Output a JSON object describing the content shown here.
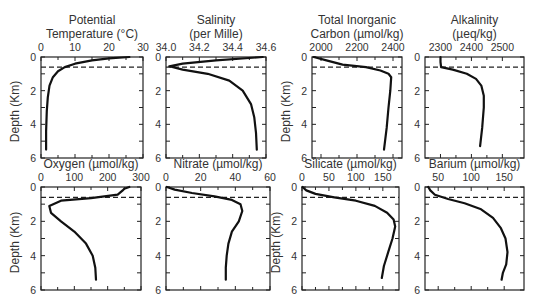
{
  "chart_data": [
    {
      "type": "line",
      "title": "Potential Temperature (°C)",
      "title_lines": [
        "Potential",
        "Temperature (°C)"
      ],
      "xlabel": "Potential Temperature (°C)",
      "ylabel": "Depth (Km)",
      "xlim": [
        0,
        30
      ],
      "xticks": [
        0,
        10,
        20,
        30
      ],
      "ylim": [
        6,
        0
      ],
      "yticks": [
        0,
        2,
        4,
        6
      ],
      "mixed_layer_depth": 0.6,
      "series": [
        {
          "name": "Potential Temperature",
          "x": [
            26,
            20,
            15,
            10,
            7,
            5,
            3.5,
            2.5,
            2,
            1.7,
            1.5,
            1.5
          ],
          "y": [
            0,
            0.08,
            0.2,
            0.4,
            0.6,
            0.85,
            1.2,
            1.7,
            2.4,
            3.2,
            4.4,
            5.5
          ]
        }
      ]
    },
    {
      "type": "line",
      "title": "Salinity (per Mille)",
      "title_lines": [
        "Salinity",
        "(per Mille)"
      ],
      "xlabel": "Salinity (per Mille)",
      "ylabel": "",
      "xlim": [
        34.0,
        34.6
      ],
      "xticks": [
        34.0,
        34.2,
        34.4,
        34.6
      ],
      "ylim": [
        6,
        0
      ],
      "yticks": [
        0,
        2,
        4,
        6
      ],
      "mixed_layer_depth": 0.6,
      "series": [
        {
          "name": "Salinity",
          "x": [
            34.58,
            34.3,
            34.1,
            34.02,
            34.1,
            34.25,
            34.38,
            34.46,
            34.51,
            34.53,
            34.54,
            34.545
          ],
          "y": [
            0,
            0.2,
            0.4,
            0.55,
            0.75,
            1.0,
            1.4,
            2.0,
            2.8,
            3.6,
            4.5,
            5.5
          ]
        }
      ]
    },
    {
      "type": "line",
      "title": "Total Inorganic Carbon (µmol/kg)",
      "title_lines": [
        "Total Inorganic",
        "Carbon (µmol/kg)"
      ],
      "xlabel": "Total Inorganic Carbon (µmol/kg)",
      "ylabel": "Depth (Km)",
      "xlim": [
        1950,
        2450
      ],
      "xticks": [
        2000,
        2200,
        2400
      ],
      "ylim": [
        6,
        0
      ],
      "yticks": [
        0,
        2,
        4,
        6
      ],
      "mixed_layer_depth": 0.6,
      "series": [
        {
          "name": "Total Inorganic Carbon",
          "x": [
            1960,
            2030,
            2120,
            2250,
            2330,
            2375,
            2390,
            2385,
            2375,
            2365,
            2350
          ],
          "y": [
            0,
            0.2,
            0.45,
            0.6,
            0.8,
            1.0,
            1.2,
            2.0,
            3.0,
            4.2,
            5.5
          ]
        }
      ]
    },
    {
      "type": "line",
      "title": "Alkalinity (µeq/kg)",
      "title_lines": [
        "Alkalinity",
        "(µeq/kg)"
      ],
      "xlabel": "Alkalinity (µeq/kg)",
      "ylabel": "",
      "xlim": [
        2250,
        2570
      ],
      "xticks": [
        2300,
        2400,
        2500
      ],
      "ylim": [
        6,
        0
      ],
      "yticks": [
        0,
        2,
        4,
        6
      ],
      "mixed_layer_depth": 0.6,
      "series": [
        {
          "name": "Alkalinity",
          "x": [
            2300,
            2300,
            2302,
            2340,
            2385,
            2415,
            2432,
            2440,
            2440,
            2435,
            2428
          ],
          "y": [
            0,
            0.3,
            0.6,
            0.75,
            1.0,
            1.3,
            1.7,
            2.3,
            3.0,
            4.2,
            5.3
          ]
        }
      ]
    },
    {
      "type": "line",
      "title": "Oxygen (µmol/kg)",
      "title_lines": [
        "Oxygen (µmol/kg)"
      ],
      "xlabel": "Oxygen (µmol/kg)",
      "ylabel": "Depth (Km)",
      "xlim": [
        0,
        300
      ],
      "xticks": [
        0,
        100,
        200,
        300
      ],
      "ylim": [
        6,
        0
      ],
      "yticks": [
        0,
        2,
        4,
        6
      ],
      "mixed_layer_depth": 0.6,
      "series": [
        {
          "name": "Oxygen",
          "x": [
            265,
            250,
            245,
            230,
            150,
            60,
            25,
            30,
            60,
            100,
            135,
            155,
            163,
            165
          ],
          "y": [
            0,
            0.1,
            0.2,
            0.45,
            0.65,
            0.8,
            1.1,
            1.5,
            2.0,
            2.6,
            3.3,
            4.0,
            4.7,
            5.4
          ]
        }
      ]
    },
    {
      "type": "line",
      "title": "Nitrate (µmol/kg)",
      "title_lines": [
        "Nitrate (µmol/kg)"
      ],
      "xlabel": "Nitrate (µmol/kg)",
      "ylabel": "",
      "xlim": [
        0,
        60
      ],
      "xticks": [
        0,
        20,
        40,
        60
      ],
      "ylim": [
        6,
        0
      ],
      "yticks": [
        0,
        2,
        4,
        6
      ],
      "mixed_layer_depth": 0.6,
      "series": [
        {
          "name": "Nitrate",
          "x": [
            0.5,
            5,
            15,
            28,
            38,
            43,
            44,
            42,
            38,
            36,
            35,
            34.5,
            34.5
          ],
          "y": [
            0,
            0.15,
            0.35,
            0.55,
            0.75,
            1.0,
            1.4,
            2.0,
            2.6,
            3.3,
            4.0,
            4.7,
            5.4
          ]
        }
      ]
    },
    {
      "type": "line",
      "title": "Silicate (µmol/kg)",
      "title_lines": [
        "Silicate (µmol/kg)"
      ],
      "xlabel": "Silicate (µmol/kg)",
      "ylabel": "Depth (Km)",
      "xlim": [
        0,
        180
      ],
      "xticks": [
        0,
        50,
        100,
        150
      ],
      "ylim": [
        6,
        0
      ],
      "yticks": [
        0,
        2,
        4,
        6
      ],
      "mixed_layer_depth": 0.6,
      "series": [
        {
          "name": "Silicate",
          "x": [
            1,
            8,
            25,
            60,
            100,
            135,
            158,
            170,
            173,
            168,
            160,
            152,
            148
          ],
          "y": [
            0,
            0.2,
            0.4,
            0.6,
            0.8,
            1.1,
            1.5,
            1.9,
            2.3,
            3.0,
            3.8,
            4.6,
            5.3
          ]
        }
      ]
    },
    {
      "type": "line",
      "title": "Barium (µmol/kg)",
      "title_lines": [
        "Barium (µmol/kg)"
      ],
      "xlabel": "Barium (µmol/kg)",
      "ylabel": "",
      "xlim": [
        30,
        180
      ],
      "xticks": [
        50,
        100,
        150
      ],
      "ylim": [
        6,
        0
      ],
      "yticks": [
        0,
        2,
        4,
        6
      ],
      "mixed_layer_depth": 0.6,
      "series": [
        {
          "name": "Barium",
          "x": [
            35,
            38,
            45,
            65,
            90,
            115,
            133,
            145,
            152,
            155,
            153,
            148,
            146
          ],
          "y": [
            0,
            0.2,
            0.45,
            0.7,
            0.95,
            1.3,
            1.8,
            2.4,
            3.0,
            3.8,
            4.5,
            5.0,
            5.4
          ]
        }
      ]
    }
  ]
}
